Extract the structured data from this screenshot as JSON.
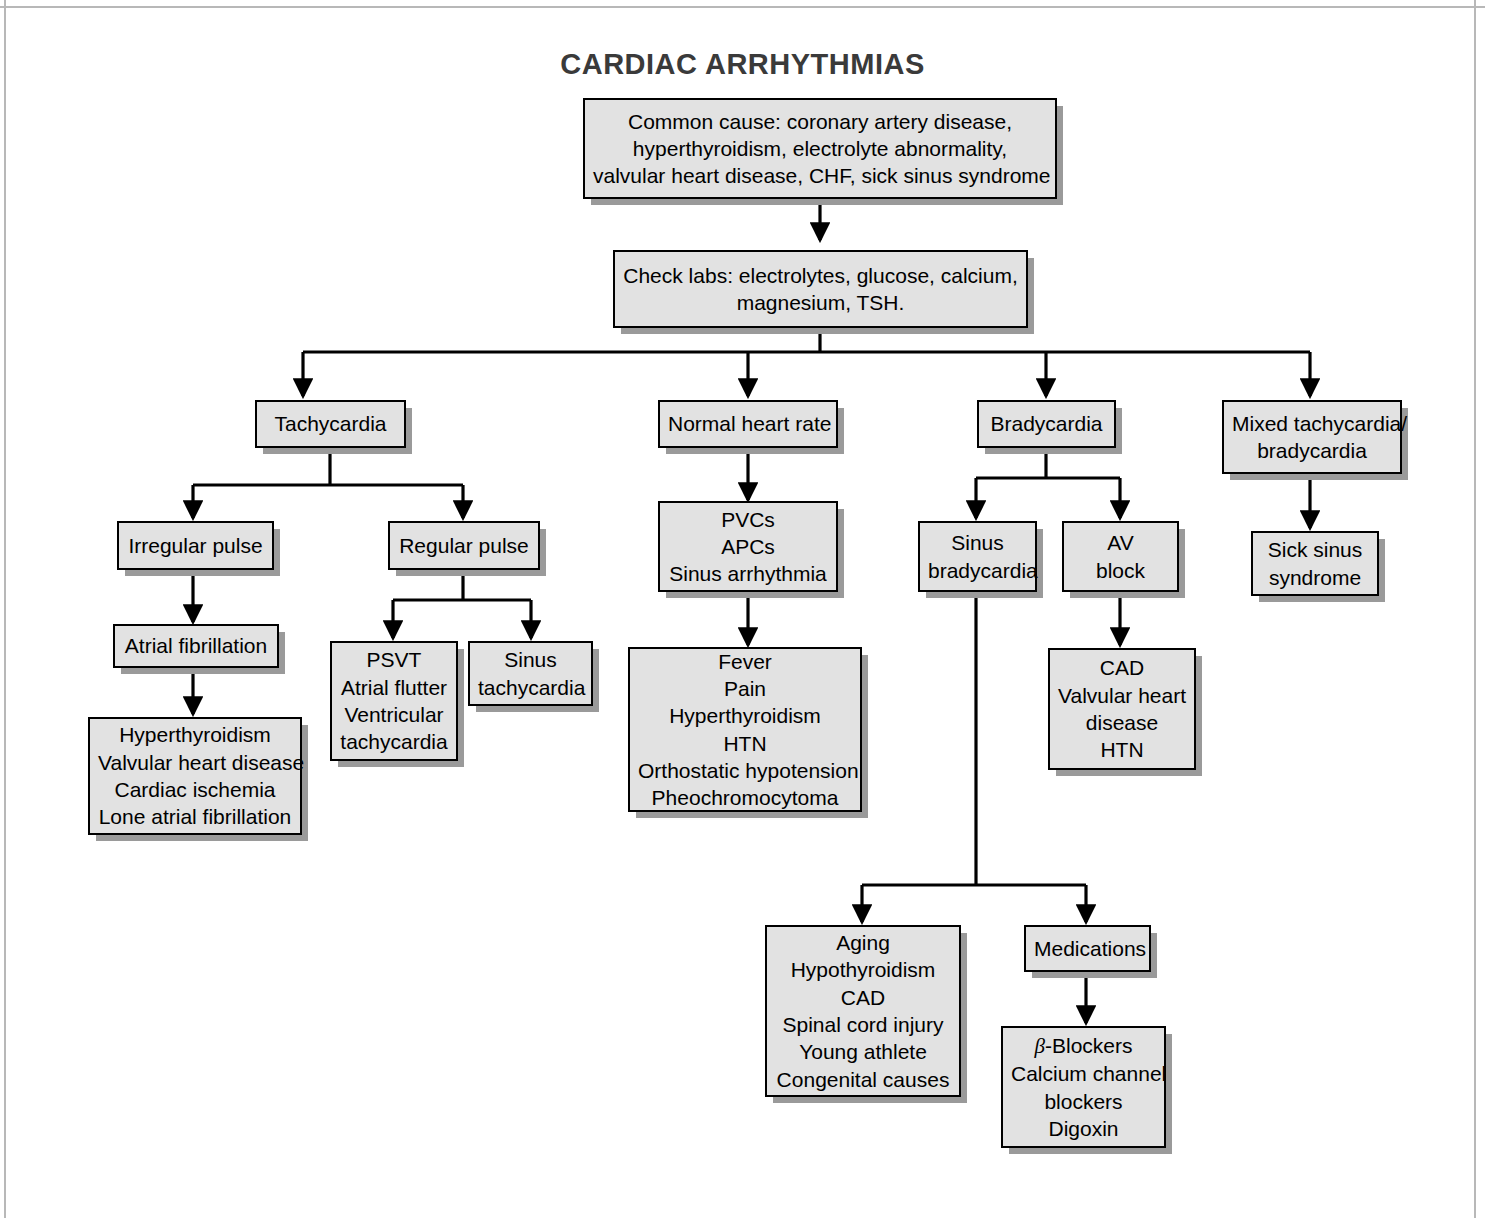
{
  "title": "CARDIAC ARRHYTHMIAS",
  "colors": {
    "node_fill": "#e2e2e2",
    "node_border": "#000000",
    "shadow": "#9a9a9a",
    "title": "#3a3a3a",
    "background": "#ffffff"
  },
  "nodes": {
    "common_cause": {
      "lines": [
        "Common cause: coronary artery disease,",
        "hyperthyroidism, electrolyte abnormality,",
        "valvular heart disease, CHF, sick sinus syndrome"
      ]
    },
    "check_labs": {
      "lines": [
        "Check labs: electrolytes, glucose, calcium,",
        "magnesium, TSH."
      ]
    },
    "tachycardia": {
      "lines": [
        "Tachycardia"
      ]
    },
    "normal_heart_rate": {
      "lines": [
        "Normal heart rate"
      ]
    },
    "bradycardia": {
      "lines": [
        "Bradycardia"
      ]
    },
    "mixed": {
      "lines": [
        "Mixed tachycardia/",
        "bradycardia"
      ]
    },
    "irregular_pulse": {
      "lines": [
        "Irregular pulse"
      ]
    },
    "regular_pulse": {
      "lines": [
        "Regular pulse"
      ]
    },
    "atrial_fibrillation": {
      "lines": [
        "Atrial fibrillation"
      ]
    },
    "af_causes": {
      "lines": [
        "Hyperthyroidism",
        "Valvular heart disease",
        "Cardiac ischemia",
        "Lone atrial fibrillation"
      ]
    },
    "psvt": {
      "lines": [
        "PSVT",
        "Atrial flutter",
        "Ventricular",
        "tachycardia"
      ]
    },
    "sinus_tachycardia": {
      "lines": [
        "Sinus",
        "tachycardia"
      ]
    },
    "pvcs": {
      "lines": [
        "PVCs",
        "APCs",
        "Sinus arrhythmia"
      ]
    },
    "pvc_causes": {
      "lines": [
        "Fever",
        "Pain",
        "Hyperthyroidism",
        "HTN",
        "Orthostatic hypotension",
        "Pheochromocytoma"
      ]
    },
    "sinus_bradycardia": {
      "lines": [
        "Sinus",
        "bradycardia"
      ]
    },
    "av_block": {
      "lines": [
        "AV",
        "block"
      ]
    },
    "av_block_causes": {
      "lines": [
        "CAD",
        "Valvular heart",
        "disease",
        "HTN"
      ]
    },
    "sick_sinus_syndrome": {
      "lines": [
        "Sick sinus",
        "syndrome"
      ]
    },
    "bradycardia_causes": {
      "lines": [
        "Aging",
        "Hypothyroidism",
        "CAD",
        "Spinal cord injury",
        "Young athlete",
        "Congenital causes"
      ]
    },
    "medications": {
      "lines": [
        "Medications"
      ]
    },
    "medication_list": {
      "lines": [
        "β-Blockers",
        "Calcium channel",
        "blockers",
        "Digoxin"
      ],
      "beta_prefix": "β",
      "beta_suffix": "-Blockers"
    }
  },
  "edges": [
    {
      "from": "common_cause",
      "to": "check_labs"
    },
    {
      "from": "check_labs",
      "to": "tachycardia"
    },
    {
      "from": "check_labs",
      "to": "normal_heart_rate"
    },
    {
      "from": "check_labs",
      "to": "bradycardia"
    },
    {
      "from": "check_labs",
      "to": "mixed"
    },
    {
      "from": "tachycardia",
      "to": "irregular_pulse"
    },
    {
      "from": "tachycardia",
      "to": "regular_pulse"
    },
    {
      "from": "irregular_pulse",
      "to": "atrial_fibrillation"
    },
    {
      "from": "atrial_fibrillation",
      "to": "af_causes"
    },
    {
      "from": "regular_pulse",
      "to": "psvt"
    },
    {
      "from": "regular_pulse",
      "to": "sinus_tachycardia"
    },
    {
      "from": "normal_heart_rate",
      "to": "pvcs"
    },
    {
      "from": "pvcs",
      "to": "pvc_causes"
    },
    {
      "from": "bradycardia",
      "to": "sinus_bradycardia"
    },
    {
      "from": "bradycardia",
      "to": "av_block"
    },
    {
      "from": "av_block",
      "to": "av_block_causes"
    },
    {
      "from": "mixed",
      "to": "sick_sinus_syndrome"
    },
    {
      "from": "sinus_bradycardia",
      "to": "bradycardia_causes"
    },
    {
      "from": "sinus_bradycardia",
      "to": "medications"
    },
    {
      "from": "medications",
      "to": "medication_list"
    }
  ]
}
